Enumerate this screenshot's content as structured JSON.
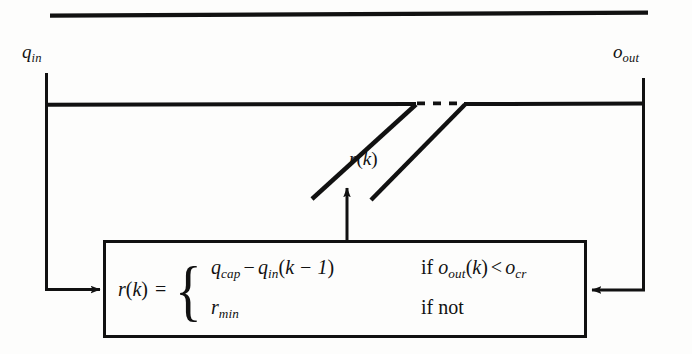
{
  "diagram": {
    "type": "block-diagram",
    "ports": {
      "inflow": {
        "symbol": "q",
        "subscript": "in",
        "text": "q_in"
      },
      "outflow": {
        "symbol": "o",
        "subscript": "out",
        "text": "o_out"
      }
    },
    "annotations": {
      "ramp_rate": {
        "text": "r(k)",
        "symbol": "r",
        "argument": "k"
      }
    },
    "controller_block": {
      "lhs": {
        "symbol": "r",
        "argument": "k",
        "text": "r(k)"
      },
      "equals": "=",
      "cases": [
        {
          "expression": {
            "term1_symbol": "q",
            "term1_subscript": "cap",
            "operator": "−",
            "term2_symbol": "q",
            "term2_subscript": "in",
            "term2_argument": "k − 1",
            "text": "q_cap − q_in(k − 1)"
          },
          "condition": {
            "keyword": "if",
            "left_symbol": "o",
            "left_subscript": "out",
            "left_argument": "k",
            "relation": "<",
            "right_symbol": "o",
            "right_subscript": "cr",
            "text": "if o_out(k) < o_cr"
          }
        },
        {
          "expression": {
            "term1_symbol": "r",
            "term1_subscript": "min",
            "text": "r_min"
          },
          "condition": {
            "keyword": "if not",
            "text": "if not"
          }
        }
      ]
    },
    "edges": [
      {
        "name": "mainline-top",
        "kind": "solid-line"
      },
      {
        "name": "mainline-carriageway",
        "kind": "solid-line"
      },
      {
        "name": "onramp-left-diagonal",
        "kind": "solid-line"
      },
      {
        "name": "onramp-right-diagonal",
        "kind": "solid-line"
      },
      {
        "name": "gap-dashes",
        "kind": "dashed-segment",
        "dash_count": 3
      },
      {
        "name": "qin-measurement-feed",
        "kind": "arrow",
        "direction": "down-then-right"
      },
      {
        "name": "oout-measurement-feed",
        "kind": "arrow",
        "direction": "down-then-left"
      },
      {
        "name": "control-output-to-ramp",
        "kind": "arrow",
        "direction": "up"
      }
    ],
    "colors": {
      "ink": "#111111",
      "background": "#fdfdfc"
    }
  }
}
